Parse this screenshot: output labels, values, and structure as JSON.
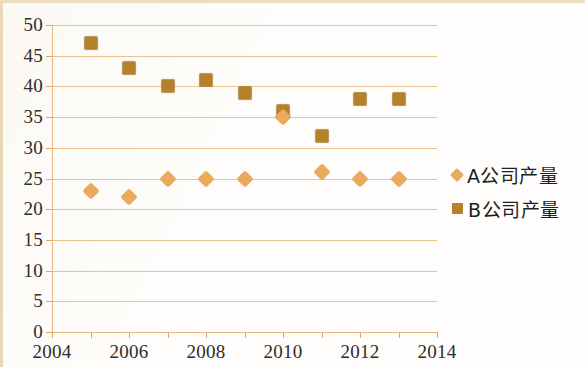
{
  "chart_data": {
    "type": "scatter",
    "title": "",
    "xlabel": "",
    "ylabel": "",
    "xlim": [
      2004,
      2014
    ],
    "ylim": [
      0,
      50
    ],
    "ytick_step": 5,
    "xtick_step": 1,
    "xtick_label_step": 2,
    "grid": true,
    "legend_position": "right",
    "x": [
      2005,
      2006,
      2007,
      2008,
      2009,
      2010,
      2011,
      2012,
      2013
    ],
    "xticks": [
      2004,
      2005,
      2006,
      2007,
      2008,
      2009,
      2010,
      2011,
      2012,
      2013,
      2014
    ],
    "xtick_labels": [
      "2004",
      "",
      "2006",
      "",
      "2008",
      "",
      "2010",
      "",
      "2012",
      "",
      "2014"
    ],
    "yticks": [
      0,
      5,
      10,
      15,
      20,
      25,
      30,
      35,
      40,
      45,
      50
    ],
    "ytick_labels": [
      "0",
      "5",
      "10",
      "15",
      "20",
      "25",
      "30",
      "35",
      "40",
      "45",
      "50"
    ],
    "series": [
      {
        "name": "A公司产量",
        "marker": "diamond",
        "color": "#eaa95d",
        "values": [
          23,
          22,
          25,
          25,
          25,
          35,
          26,
          25,
          25
        ]
      },
      {
        "name": "B公司产量",
        "marker": "square",
        "color": "#b5822c",
        "values": [
          47,
          43,
          40,
          41,
          39,
          36,
          32,
          38,
          38
        ]
      }
    ]
  },
  "legend": {
    "items": [
      {
        "label": "A公司产量",
        "marker": "diamond",
        "color": "#eaa95d"
      },
      {
        "label": "B公司产量",
        "marker": "square",
        "color": "#b5822c"
      }
    ]
  },
  "colors": {
    "gridline": "#e8b97e",
    "axis": "#d9a86a",
    "text": "#2d2d2c",
    "background": "#fefdfb",
    "series_a": "#eaa95d",
    "series_b": "#b5822c"
  }
}
